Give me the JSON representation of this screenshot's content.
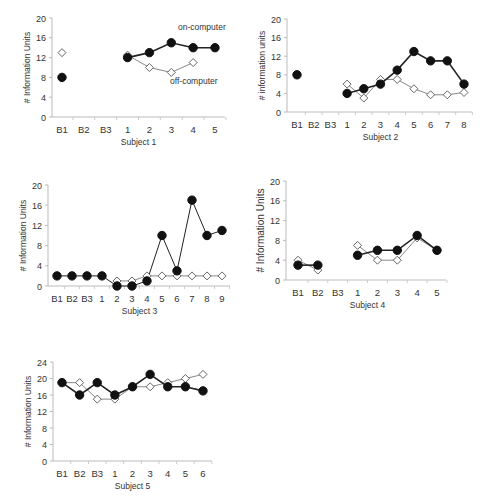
{
  "chart_data": [
    {
      "type": "line",
      "title": "",
      "xlabel": "Subject 1",
      "ylabel": "# Information Units",
      "ylim": [
        0,
        20
      ],
      "yticks": [
        0,
        4,
        8,
        12,
        16,
        20
      ],
      "categories": [
        "B1",
        "B2",
        "B3",
        "1",
        "2",
        "3",
        "4",
        "5"
      ],
      "annotations": [
        {
          "text": "on-computer",
          "near": "4"
        },
        {
          "text": "off-computer",
          "near": "3"
        }
      ],
      "series": [
        {
          "name": "on-computer",
          "marker": "filled-circle",
          "values": [
            8,
            null,
            null,
            12,
            13,
            15,
            14,
            14
          ]
        },
        {
          "name": "off-computer",
          "marker": "open-diamond",
          "values": [
            13,
            null,
            null,
            12.5,
            10,
            9,
            11,
            null
          ]
        }
      ],
      "layout": {
        "ax": 52,
        "top": 18,
        "bottom": 117,
        "x0": 62,
        "x1": 215,
        "right": 225
      }
    },
    {
      "type": "line",
      "title": "",
      "xlabel": "Subject 2",
      "ylabel": "# information units",
      "ylim": [
        0,
        20
      ],
      "yticks": [
        0,
        4,
        8,
        12,
        16,
        20
      ],
      "categories": [
        "B1",
        "B2",
        "B3",
        "1",
        "2",
        "3",
        "4",
        "5",
        "6",
        "7",
        "8"
      ],
      "series": [
        {
          "name": "on-computer",
          "marker": "filled-circle",
          "values": [
            8,
            null,
            null,
            4,
            5,
            6,
            9,
            13,
            11,
            11,
            6
          ]
        },
        {
          "name": "off-computer",
          "marker": "open-diamond",
          "values": [
            null,
            null,
            null,
            6,
            3,
            7,
            7,
            5,
            3.7,
            3.7,
            4.2
          ]
        }
      ],
      "layout": {
        "ax": 287,
        "top": 19,
        "bottom": 112,
        "x0": 297,
        "x1": 464,
        "right": 472
      }
    },
    {
      "type": "line",
      "title": "",
      "xlabel": "Subject 3",
      "ylabel": "# Information Units",
      "ylim": [
        0,
        20
      ],
      "yticks": [
        0,
        4,
        8,
        12,
        16,
        20
      ],
      "categories": [
        "B1",
        "B2",
        "B3",
        "1",
        "2",
        "3",
        "4",
        "5",
        "6",
        "7",
        "8",
        "9"
      ],
      "series": [
        {
          "name": "on-computer",
          "marker": "filled-circle",
          "values": [
            2,
            2,
            2,
            2,
            0,
            0,
            1,
            10,
            3,
            17,
            10,
            11
          ]
        },
        {
          "name": "off-computer",
          "marker": "open-diamond",
          "values": [
            null,
            null,
            null,
            null,
            1,
            1,
            2,
            2,
            2,
            2,
            2,
            2
          ]
        }
      ],
      "layout": {
        "ax": 48,
        "top": 185,
        "bottom": 286,
        "x0": 57,
        "x1": 222,
        "right": 230
      }
    },
    {
      "type": "line",
      "title": "",
      "xlabel": "Subject 4",
      "ylabel": "# Information Units",
      "ylim": [
        0,
        20
      ],
      "yticks": [
        0,
        4,
        8,
        12,
        16,
        20
      ],
      "categories": [
        "B1",
        "B2",
        "B3",
        "1",
        "2",
        "3",
        "4",
        "5"
      ],
      "series": [
        {
          "name": "on-computer",
          "marker": "filled-circle",
          "values": [
            3,
            3,
            null,
            5,
            6,
            6,
            9,
            6
          ]
        },
        {
          "name": "off-computer",
          "marker": "open-diamond",
          "values": [
            4,
            2,
            null,
            7,
            4,
            4,
            8.5,
            6
          ]
        }
      ],
      "layout": {
        "ax": 286,
        "top": 181,
        "bottom": 280,
        "x0": 298,
        "x1": 437,
        "right": 446
      }
    },
    {
      "type": "line",
      "title": "",
      "xlabel": "Subject 5",
      "ylabel": "# Information Units",
      "ylim": [
        0,
        24
      ],
      "yticks": [
        0,
        4,
        8,
        12,
        16,
        20,
        24
      ],
      "categories": [
        "B1",
        "B2",
        "B3",
        "1",
        "2",
        "3",
        "4",
        "5",
        "6"
      ],
      "series": [
        {
          "name": "on-computer",
          "marker": "filled-circle",
          "values": [
            19,
            16,
            19,
            16,
            18,
            21,
            18,
            18,
            17
          ]
        },
        {
          "name": "off-computer",
          "marker": "open-diamond",
          "values": [
            19,
            19,
            15,
            15,
            18,
            18,
            19,
            20,
            21
          ]
        }
      ],
      "layout": {
        "ax": 53,
        "top": 362,
        "bottom": 461,
        "x0": 62,
        "x1": 203,
        "right": 212
      }
    }
  ]
}
